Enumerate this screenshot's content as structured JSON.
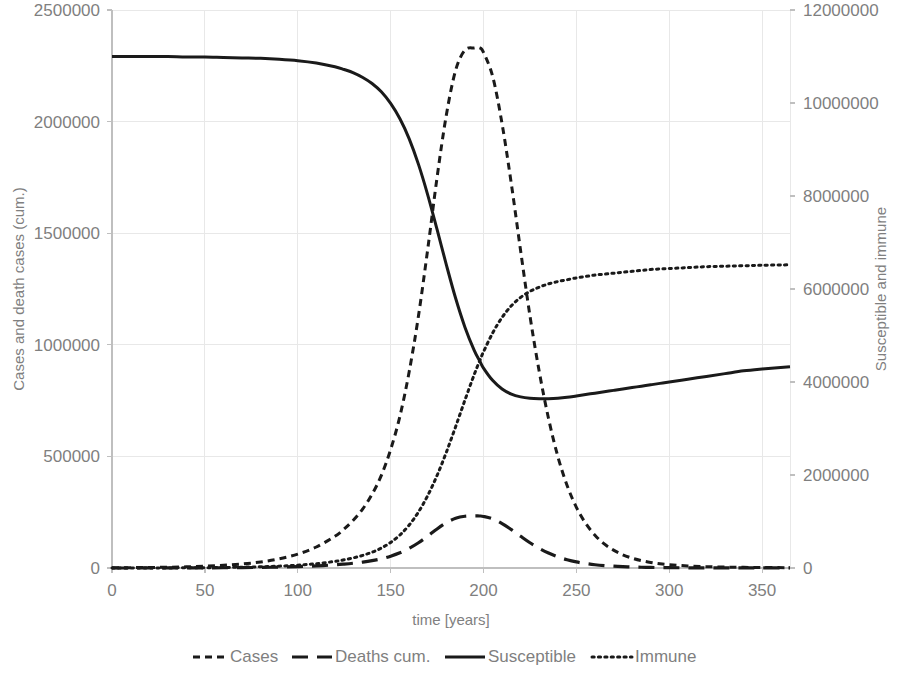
{
  "chart_data": {
    "type": "line",
    "title": "",
    "xlabel": "time [years]",
    "ylabel": "Cases and death cases (cum.)",
    "y2label": "Susceptible and immune",
    "xlim": [
      0,
      365
    ],
    "ylim": [
      0,
      2500000
    ],
    "y2lim": [
      0,
      12000000
    ],
    "grid": true,
    "legend_position": "bottom",
    "x_ticks": [
      0,
      50,
      100,
      150,
      200,
      250,
      300,
      350
    ],
    "x_tick_labels": [
      "0",
      "50",
      "100",
      "150",
      "200",
      "250",
      "300",
      "350"
    ],
    "y_ticks": [
      0,
      500000,
      1000000,
      1500000,
      2000000,
      2500000
    ],
    "y_tick_labels": [
      "0",
      "500000",
      "1000000",
      "1500000",
      "2000000",
      "2500000"
    ],
    "y2_ticks": [
      0,
      2000000,
      4000000,
      6000000,
      8000000,
      10000000,
      12000000
    ],
    "y2_tick_labels": [
      "0",
      "2000000",
      "4000000",
      "6000000",
      "8000000",
      "10000000",
      "12000000"
    ],
    "x": [
      0,
      10,
      20,
      30,
      40,
      50,
      60,
      70,
      80,
      90,
      100,
      110,
      120,
      125,
      130,
      135,
      140,
      145,
      150,
      155,
      160,
      165,
      170,
      175,
      180,
      185,
      190,
      195,
      198,
      200,
      205,
      210,
      215,
      220,
      225,
      230,
      235,
      240,
      245,
      250,
      255,
      260,
      265,
      270,
      275,
      280,
      285,
      290,
      295,
      300,
      310,
      320,
      330,
      340,
      350,
      365
    ],
    "series": [
      {
        "name": "Cases",
        "axis": "left",
        "style": "short-dash",
        "values": [
          1000,
          1500,
          2300,
          3500,
          5300,
          8000,
          12000,
          18000,
          27000,
          41000,
          62000,
          94000,
          142000,
          175000,
          215000,
          265000,
          330000,
          415000,
          530000,
          680000,
          880000,
          1130000,
          1430000,
          1750000,
          2030000,
          2230000,
          2320000,
          2330000,
          2330000,
          2310000,
          2200000,
          1990000,
          1720000,
          1420000,
          1130000,
          880000,
          670000,
          500000,
          370000,
          272000,
          200000,
          147000,
          108000,
          80000,
          59000,
          44000,
          33000,
          25000,
          19000,
          15000,
          9000,
          6000,
          4000,
          3000,
          2200,
          1500
        ]
      },
      {
        "name": "Deaths cum.",
        "axis": "left",
        "style": "long-dash",
        "values": [
          0,
          100,
          200,
          350,
          550,
          800,
          1200,
          1800,
          2700,
          4100,
          6200,
          9400,
          14200,
          17500,
          21500,
          26500,
          33000,
          41500,
          53000,
          68000,
          88000,
          113000,
          143000,
          175000,
          203000,
          223000,
          232000,
          233000,
          233000,
          231000,
          220000,
          199000,
          172000,
          142000,
          113000,
          88000,
          67000,
          50000,
          37000,
          27200,
          20000,
          14700,
          10800,
          8000,
          5900,
          4400,
          3300,
          2500,
          1900,
          1500,
          900,
          600,
          400,
          300,
          220,
          150
        ]
      },
      {
        "name": "Susceptible",
        "axis": "right",
        "style": "solid",
        "values": [
          11000000,
          11000000,
          11000000,
          11000000,
          10990000,
          10990000,
          10980000,
          10970000,
          10960000,
          10940000,
          10910000,
          10860000,
          10780000,
          10720000,
          10650000,
          10550000,
          10420000,
          10240000,
          9990000,
          9660000,
          9230000,
          8680000,
          8020000,
          7280000,
          6520000,
          5800000,
          5180000,
          4680000,
          4450000,
          4300000,
          4030000,
          3850000,
          3740000,
          3680000,
          3650000,
          3640000,
          3640000,
          3650000,
          3670000,
          3700000,
          3730000,
          3760000,
          3790000,
          3820000,
          3850000,
          3880000,
          3910000,
          3940000,
          3970000,
          4000000,
          4060000,
          4120000,
          4180000,
          4240000,
          4280000,
          4330000
        ]
      },
      {
        "name": "Immune",
        "axis": "right",
        "style": "dotted",
        "values": [
          0,
          0,
          1000,
          2000,
          4000,
          7000,
          11000,
          17000,
          26000,
          40000,
          61000,
          93000,
          142000,
          176000,
          218000,
          272000,
          340000,
          430000,
          550000,
          710000,
          925000,
          1205000,
          1560000,
          1990000,
          2490000,
          3040000,
          3610000,
          4160000,
          4460000,
          4650000,
          5060000,
          5390000,
          5640000,
          5820000,
          5950000,
          6040000,
          6110000,
          6160000,
          6200000,
          6240000,
          6270000,
          6300000,
          6320000,
          6340000,
          6360000,
          6380000,
          6400000,
          6420000,
          6430000,
          6440000,
          6460000,
          6480000,
          6490000,
          6500000,
          6510000,
          6520000
        ]
      }
    ],
    "legend": [
      {
        "label": "Cases",
        "style": "short-dash"
      },
      {
        "label": "Deaths cum.",
        "style": "long-dash"
      },
      {
        "label": "Susceptible",
        "style": "solid"
      },
      {
        "label": "Immune",
        "style": "dotted"
      }
    ]
  }
}
